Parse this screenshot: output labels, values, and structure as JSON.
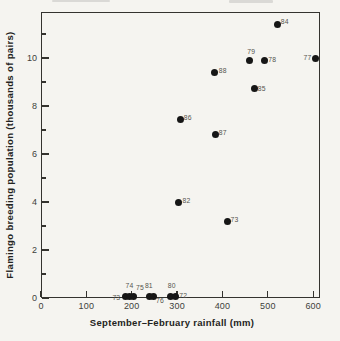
{
  "figure": {
    "background_color": "#f5f4f0",
    "frame_color": "#34332f",
    "dot_color": "#161616",
    "point_label_color": "#55544f",
    "tick_label_color": "#403f3b",
    "axis_title_color": "#232320"
  },
  "chart_data": {
    "type": "scatter",
    "title": "",
    "xlabel": "September–February rainfall (mm)",
    "ylabel": "Flamingo breeding population (thousands of pairs)",
    "xlim": [
      0,
      615
    ],
    "ylim": [
      0,
      11.92
    ],
    "grid": false,
    "legend": "none",
    "x_ticks_major": [
      0,
      100,
      200,
      300,
      400,
      500,
      600
    ],
    "y_ticks_major": [
      0,
      2,
      4,
      6,
      8,
      10
    ],
    "y_ticks_minor": [
      1,
      3,
      5,
      7,
      9,
      11
    ],
    "marker": "filled-black-circle",
    "points": [
      {
        "year": "84",
        "rainfall_mm": 521,
        "population_kpairs": 11.4,
        "dx": 7.5,
        "dy": -3
      },
      {
        "year": "79",
        "rainfall_mm": 460,
        "population_kpairs": 9.9,
        "dx": 1.5,
        "dy": -8.5
      },
      {
        "year": "78",
        "rainfall_mm": 492,
        "population_kpairs": 9.9,
        "dx": 8,
        "dy": -0.5
      },
      {
        "year": "77",
        "rainfall_mm": 606,
        "population_kpairs": 10.0,
        "dx": -8.5,
        "dy": -1
      },
      {
        "year": "88",
        "rainfall_mm": 383,
        "population_kpairs": 9.4,
        "dx": 8,
        "dy": -2
      },
      {
        "year": "85",
        "rainfall_mm": 470,
        "population_kpairs": 8.75,
        "dx": 7.5,
        "dy": 0
      },
      {
        "year": "86",
        "rainfall_mm": 308,
        "population_kpairs": 7.45,
        "dx": 7,
        "dy": -2
      },
      {
        "year": "87",
        "rainfall_mm": 384,
        "population_kpairs": 6.8,
        "dx": 7.5,
        "dy": -2.5
      },
      {
        "year": "82",
        "rainfall_mm": 303,
        "population_kpairs": 4.0,
        "dx": 8,
        "dy": -2
      },
      {
        "year": "73",
        "rainfall_mm": 412,
        "population_kpairs": 3.2,
        "dx": 6.5,
        "dy": -2
      },
      {
        "year": "73",
        "rainfall_mm": 186,
        "population_kpairs": 0.05,
        "dx": -9,
        "dy": 1
      },
      {
        "year": "74",
        "rainfall_mm": 194,
        "population_kpairs": 0.05,
        "dx": 0.5,
        "dy": -11
      },
      {
        "year": "75",
        "rainfall_mm": 204,
        "population_kpairs": 0.05,
        "dx": 6.5,
        "dy": -9
      },
      {
        "year": "81",
        "rainfall_mm": 240,
        "population_kpairs": 0.05,
        "dx": -1,
        "dy": -11
      },
      {
        "year": "76",
        "rainfall_mm": 249,
        "population_kpairs": 0.05,
        "dx": 6,
        "dy": 3.5
      },
      {
        "year": "80",
        "rainfall_mm": 286,
        "population_kpairs": 0.05,
        "dx": 1,
        "dy": -11
      },
      {
        "year": "72",
        "rainfall_mm": 296,
        "population_kpairs": 0.05,
        "dx": 8,
        "dy": -1
      }
    ]
  }
}
